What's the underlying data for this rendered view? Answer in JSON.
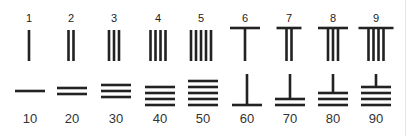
{
  "colors": {
    "ink": "#222222",
    "background": "#ffffff"
  },
  "units_row": {
    "orientation": "vertical",
    "items": [
      {
        "label": "1",
        "value": 1,
        "vertical_strokes": 1,
        "horizontal_bar": false,
        "x": 29
      },
      {
        "label": "2",
        "value": 2,
        "vertical_strokes": 2,
        "horizontal_bar": false,
        "x": 71
      },
      {
        "label": "3",
        "value": 3,
        "vertical_strokes": 3,
        "horizontal_bar": false,
        "x": 114
      },
      {
        "label": "4",
        "value": 4,
        "vertical_strokes": 4,
        "horizontal_bar": false,
        "x": 158
      },
      {
        "label": "5",
        "value": 5,
        "vertical_strokes": 5,
        "horizontal_bar": false,
        "x": 201
      },
      {
        "label": "6",
        "value": 6,
        "vertical_strokes": 1,
        "horizontal_bar": true,
        "x": 245
      },
      {
        "label": "7",
        "value": 7,
        "vertical_strokes": 2,
        "horizontal_bar": true,
        "x": 289
      },
      {
        "label": "8",
        "value": 8,
        "vertical_strokes": 3,
        "horizontal_bar": true,
        "x": 333
      },
      {
        "label": "9",
        "value": 9,
        "vertical_strokes": 4,
        "horizontal_bar": true,
        "x": 376
      }
    ]
  },
  "tens_row": {
    "orientation": "horizontal",
    "items": [
      {
        "label": "10",
        "value": 10,
        "horizontal_strokes": 1,
        "vertical_bar": false,
        "x": 30
      },
      {
        "label": "20",
        "value": 20,
        "horizontal_strokes": 2,
        "vertical_bar": false,
        "x": 72
      },
      {
        "label": "30",
        "value": 30,
        "horizontal_strokes": 3,
        "vertical_bar": false,
        "x": 116
      },
      {
        "label": "40",
        "value": 40,
        "horizontal_strokes": 4,
        "vertical_bar": false,
        "x": 160
      },
      {
        "label": "50",
        "value": 50,
        "horizontal_strokes": 5,
        "vertical_bar": false,
        "x": 203
      },
      {
        "label": "60",
        "value": 60,
        "horizontal_strokes": 1,
        "vertical_bar": true,
        "x": 247
      },
      {
        "label": "70",
        "value": 70,
        "horizontal_strokes": 2,
        "vertical_bar": true,
        "x": 290
      },
      {
        "label": "80",
        "value": 80,
        "horizontal_strokes": 3,
        "vertical_bar": true,
        "x": 333
      },
      {
        "label": "90",
        "value": 90,
        "horizontal_strokes": 4,
        "vertical_bar": true,
        "x": 376
      }
    ]
  }
}
